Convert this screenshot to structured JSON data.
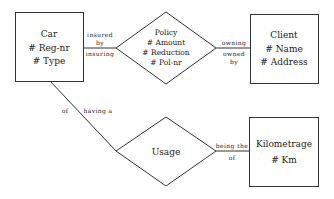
{
  "diagram": {
    "type": "entity-relationship",
    "entities": [
      {
        "id": "car",
        "name": "Car",
        "attributes": [
          "# Reg-nr",
          "# Type"
        ]
      },
      {
        "id": "client",
        "name": "Client",
        "attributes": [
          "# Name",
          "# Address"
        ]
      },
      {
        "id": "kilometrage",
        "name": "Kilometrage",
        "attributes": [
          "# Km"
        ]
      }
    ],
    "relationships": [
      {
        "id": "policy",
        "name": "Policy",
        "attributes": [
          "# Amount",
          "# Reduction",
          "# Pol-nr"
        ]
      },
      {
        "id": "usage",
        "name": "Usage",
        "attributes": []
      }
    ],
    "roles": {
      "car_policy_top": [
        "insured",
        "by"
      ],
      "car_policy_bottom": "insuring",
      "policy_client_top": "owning",
      "policy_client_bottom": [
        "owned",
        "by"
      ],
      "car_usage_left": "of",
      "car_usage_right": "having a",
      "usage_km_top": "being the",
      "usage_km_bottom": "of"
    },
    "line_color": "#333333"
  }
}
